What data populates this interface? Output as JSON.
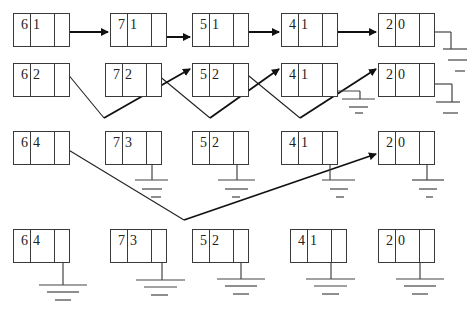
{
  "diagram": {
    "type": "linked-list-hash-chains",
    "rows": [
      {
        "id": "row1",
        "nodes": [
          {
            "a": "6",
            "b": "1",
            "x": 13,
            "y": 13
          },
          {
            "a": "7",
            "b": "1",
            "x": 110,
            "y": 13
          },
          {
            "a": "5",
            "b": "1",
            "x": 192,
            "y": 13
          },
          {
            "a": "4",
            "b": "1",
            "x": 281,
            "y": 13
          },
          {
            "a": "2",
            "b": "0",
            "x": 378,
            "y": 13
          }
        ]
      },
      {
        "id": "row2",
        "nodes": [
          {
            "a": "6",
            "b": "2",
            "x": 13,
            "y": 63
          },
          {
            "a": "7",
            "b": "2",
            "x": 105,
            "y": 63
          },
          {
            "a": "5",
            "b": "2",
            "x": 192,
            "y": 63
          },
          {
            "a": "4",
            "b": "1",
            "x": 281,
            "y": 63
          },
          {
            "a": "2",
            "b": "0",
            "x": 378,
            "y": 63
          }
        ]
      },
      {
        "id": "row3",
        "nodes": [
          {
            "a": "6",
            "b": "4",
            "x": 13,
            "y": 131
          },
          {
            "a": "7",
            "b": "3",
            "x": 105,
            "y": 131
          },
          {
            "a": "5",
            "b": "2",
            "x": 192,
            "y": 131
          },
          {
            "a": "4",
            "b": "1",
            "x": 281,
            "y": 131
          },
          {
            "a": "2",
            "b": "0",
            "x": 378,
            "y": 131
          }
        ]
      },
      {
        "id": "row4",
        "nodes": [
          {
            "a": "6",
            "b": "4",
            "x": 13,
            "y": 229
          },
          {
            "a": "7",
            "b": "3",
            "x": 110,
            "y": 229
          },
          {
            "a": "5",
            "b": "2",
            "x": 192,
            "y": 229
          },
          {
            "a": "4",
            "b": "1",
            "x": 290,
            "y": 229
          },
          {
            "a": "2",
            "b": "0",
            "x": 378,
            "y": 229
          }
        ]
      }
    ],
    "colors": {
      "line": "#1a1a1a",
      "box": "#3a3a3a",
      "text": "#222222"
    }
  }
}
